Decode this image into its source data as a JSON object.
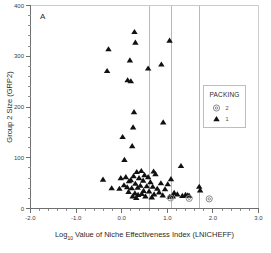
{
  "panel": {
    "label": "A"
  },
  "chart_data": {
    "type": "scatter",
    "title": "",
    "xlabel": "Log10 Value of Niche Effectiveness Index (LNICHEFF)",
    "xlabel_main": "Log",
    "xlabel_sub": "10",
    "xlabel_rest": " Value of Niche Effectiveness Index (LNICHEFF)",
    "ylabel": "Group 2 Size (GRP2)",
    "xlim": [
      -2.0,
      3.0
    ],
    "ylim": [
      0,
      400
    ],
    "xticks": [
      -2.0,
      -1.0,
      0.0,
      1.0,
      2.0,
      3.0
    ],
    "xticklabels": [
      "-2.0",
      "-1.0",
      "0.0",
      "1.0",
      "2.0",
      "3.0"
    ],
    "xminor_step": 0.2,
    "yticks": [
      0,
      100,
      200,
      300,
      400
    ],
    "yticklabels": [
      "0",
      "100",
      "200",
      "300",
      "400"
    ],
    "yminor_step": 20,
    "grid": false,
    "reference_lines_x": [
      0.6,
      1.1,
      1.7
    ],
    "legend": {
      "position": "right-upper",
      "title": "PACKING",
      "entries": [
        {
          "label": "2",
          "marker": "circle",
          "color": "#8a8a8a"
        },
        {
          "label": "1",
          "marker": "triangle",
          "color": "#111111"
        }
      ]
    },
    "series": [
      {
        "name": "1",
        "marker": "triangle",
        "color": "#111111",
        "points": [
          [
            0.28,
            348
          ],
          [
            0.3,
            327
          ],
          [
            1.05,
            331
          ],
          [
            -0.29,
            314
          ],
          [
            0.18,
            292
          ],
          [
            0.87,
            284
          ],
          [
            0.58,
            276
          ],
          [
            -0.32,
            271
          ],
          [
            0.13,
            253
          ],
          [
            0.2,
            251
          ],
          [
            0.27,
            190
          ],
          [
            0.91,
            170
          ],
          [
            0.25,
            160
          ],
          [
            0.02,
            141
          ],
          [
            0.23,
            123
          ],
          [
            0.06,
            96
          ],
          [
            1.3,
            84
          ],
          [
            0.43,
            74
          ],
          [
            0.7,
            73
          ],
          [
            0.33,
            72
          ],
          [
            0.74,
            68
          ],
          [
            0.5,
            66
          ],
          [
            0.26,
            64
          ],
          [
            0.09,
            62
          ],
          [
            -0.02,
            60
          ],
          [
            0.38,
            60
          ],
          [
            0.58,
            62
          ],
          [
            1.08,
            58
          ],
          [
            -0.41,
            57
          ],
          [
            0.2,
            56
          ],
          [
            0.47,
            55
          ],
          [
            0.16,
            54
          ],
          [
            0.63,
            52
          ],
          [
            0.86,
            50
          ],
          [
            0.3,
            49
          ],
          [
            1.01,
            48
          ],
          [
            0.05,
            46
          ],
          [
            0.41,
            45
          ],
          [
            0.55,
            44
          ],
          [
            0.68,
            43
          ],
          [
            1.7,
            43
          ],
          [
            0.12,
            42
          ],
          [
            0.35,
            41
          ],
          [
            0.22,
            40
          ],
          [
            0.78,
            39
          ],
          [
            -0.22,
            40
          ],
          [
            -0.05,
            39
          ],
          [
            0.95,
            38
          ],
          [
            1.72,
            36
          ],
          [
            0.48,
            35
          ],
          [
            0.6,
            34
          ],
          [
            0.15,
            33
          ],
          [
            0.82,
            32
          ],
          [
            1.15,
            31
          ],
          [
            0.29,
            30
          ],
          [
            0.44,
            29
          ],
          [
            0.71,
            28
          ],
          [
            1.22,
            28
          ],
          [
            0.36,
            27
          ],
          [
            0.9,
            26
          ],
          [
            1.4,
            27
          ],
          [
            1.45,
            26
          ],
          [
            1.48,
            25
          ],
          [
            0.24,
            24
          ],
          [
            0.52,
            24
          ],
          [
            1.05,
            23
          ],
          [
            0.66,
            22
          ],
          [
            0.32,
            21
          ],
          [
            1.33,
            25
          ],
          [
            1.12,
            24
          ]
        ]
      },
      {
        "name": "2",
        "marker": "circle",
        "color": "#8a8a8a",
        "points": [
          [
            1.07,
            21
          ],
          [
            1.48,
            20
          ],
          [
            1.92,
            19
          ]
        ]
      }
    ]
  }
}
